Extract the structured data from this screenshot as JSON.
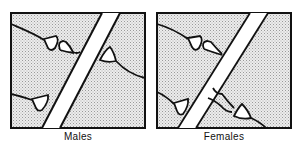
{
  "figure": {
    "panels": [
      {
        "id": "males",
        "label": "Males",
        "synapse_contacts": 4
      },
      {
        "id": "females",
        "label": "Females",
        "synapse_contacts": 5
      }
    ],
    "colors": {
      "stipple": "#c8c8c8",
      "background": "#f2f2f2",
      "outline": "#111111",
      "process_fill": "#ffffff"
    }
  }
}
